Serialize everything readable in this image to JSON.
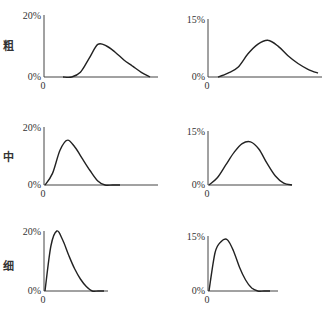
{
  "rows": [
    {
      "label": "粗",
      "label_meaning": "coarse"
    },
    {
      "label": "中",
      "label_meaning": "medium"
    },
    {
      "label": "细",
      "label_meaning": "fine"
    }
  ],
  "chart_data": [
    {
      "type": "line",
      "row": "粗",
      "column": "left",
      "ylabel": "",
      "xlabel": "",
      "yticks": [
        "0%",
        "20%"
      ],
      "xticks": [
        "0"
      ],
      "ylim": [
        0,
        20
      ],
      "grid": false,
      "x": [
        0,
        1,
        2,
        3,
        4,
        5,
        6,
        7,
        8,
        9,
        10
      ],
      "values": [
        0,
        0,
        1.5,
        6,
        10.5,
        10,
        8,
        5.5,
        3.5,
        1.5,
        0
      ]
    },
    {
      "type": "line",
      "row": "粗",
      "column": "right",
      "ylabel": "",
      "xlabel": "",
      "yticks": [
        "0%",
        "15%"
      ],
      "xticks": [
        "0"
      ],
      "ylim": [
        0,
        15
      ],
      "grid": false,
      "x": [
        0,
        1,
        2,
        3,
        4,
        5,
        6,
        7,
        8,
        9,
        10
      ],
      "values": [
        0,
        1,
        2.5,
        6,
        8.5,
        9.5,
        8,
        5.5,
        3.5,
        2,
        1
      ]
    },
    {
      "type": "line",
      "row": "中",
      "column": "left",
      "ylabel": "",
      "xlabel": "",
      "yticks": [
        "0%",
        "20%"
      ],
      "xticks": [
        "0"
      ],
      "ylim": [
        0,
        20
      ],
      "grid": false,
      "x": [
        0,
        1,
        2,
        3,
        4,
        5,
        6,
        7,
        8,
        9,
        10
      ],
      "values": [
        0,
        4,
        12,
        15.5,
        13,
        9,
        5,
        1.5,
        0,
        0,
        0
      ]
    },
    {
      "type": "line",
      "row": "中",
      "column": "right",
      "ylabel": "",
      "xlabel": "",
      "yticks": [
        "0%",
        "15%"
      ],
      "xticks": [
        "0"
      ],
      "ylim": [
        0,
        15
      ],
      "grid": false,
      "x": [
        0,
        1,
        2,
        3,
        4,
        5,
        6,
        7,
        8,
        9,
        10
      ],
      "values": [
        0,
        2,
        5.5,
        9,
        11.5,
        12,
        10,
        6,
        2.5,
        0.5,
        0
      ]
    },
    {
      "type": "line",
      "row": "细",
      "column": "left",
      "ylabel": "",
      "xlabel": "",
      "yticks": [
        "0%",
        "20%"
      ],
      "xticks": [
        "0"
      ],
      "ylim": [
        0,
        20
      ],
      "grid": false,
      "x": [
        0,
        1,
        2,
        3,
        4,
        5,
        6,
        7,
        8,
        9,
        10
      ],
      "values": [
        0,
        15,
        20,
        17,
        12,
        7.5,
        4,
        1.5,
        0,
        0,
        0
      ]
    },
    {
      "type": "line",
      "row": "细",
      "column": "right",
      "ylabel": "",
      "xlabel": "",
      "yticks": [
        "0%",
        "15%"
      ],
      "xticks": [
        "0"
      ],
      "ylim": [
        0,
        15
      ],
      "grid": false,
      "x": [
        0,
        1,
        2,
        3,
        4,
        5,
        6,
        7,
        8,
        9,
        10
      ],
      "values": [
        0,
        10.5,
        13.5,
        14,
        11,
        6.5,
        3,
        0.8,
        0,
        0,
        0
      ]
    }
  ]
}
